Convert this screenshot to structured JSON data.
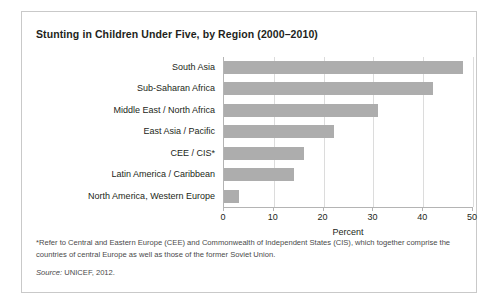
{
  "figure": {
    "title": "Stunting in Children Under Five, by Region (2000–2010)",
    "footnote": "*Refer to Central and Eastern Europe (CEE) and Commonwealth of Independent States (CIS), which together comprise the countries of central Europe as well as those of the former Soviet Union.",
    "source_label": "Source:",
    "source_text": " UNICEF, 2012.",
    "border_color": "#c9c9c9"
  },
  "chart_data": {
    "type": "bar",
    "orientation": "horizontal",
    "title": "Stunting in Children Under Five, by Region (2000–2010)",
    "xlabel": "Percent",
    "ylabel": "",
    "xlim": [
      0,
      50
    ],
    "xticks": [
      0,
      10,
      20,
      30,
      40,
      50
    ],
    "xtick_labels": [
      "0",
      "10",
      "20",
      "30",
      "40",
      "50"
    ],
    "grid": true,
    "legend": false,
    "bar_color": "#adadad",
    "categories": [
      "South Asia",
      "Sub-Saharan Africa",
      "Middle East / North Africa",
      "East Asia / Pacific",
      "CEE / CIS*",
      "Latin America / Caribbean",
      "North America, Western Europe"
    ],
    "values": [
      48,
      42,
      31,
      22,
      16,
      14,
      3
    ],
    "units": "percent"
  }
}
